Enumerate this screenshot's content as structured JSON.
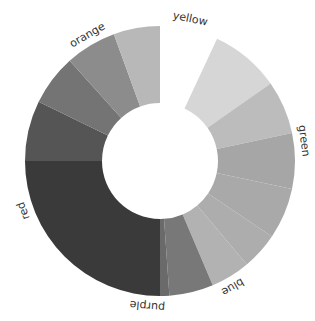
{
  "chart_data": {
    "type": "pie",
    "variant": "donut",
    "title": "",
    "color_scheme": "grayscale",
    "start_gap_degrees": [
      0,
      25
    ],
    "groups": [
      {
        "name": "yellow",
        "label_angle": 12
      },
      {
        "name": "green",
        "label_angle": 82
      },
      {
        "name": "blue",
        "label_angle": 150
      },
      {
        "name": "purple",
        "label_angle": 185
      },
      {
        "name": "red",
        "label_angle": 250
      },
      {
        "name": "orange",
        "label_angle": 330
      }
    ],
    "segments": [
      {
        "group": "yellow",
        "start": 25,
        "end": 55,
        "color": "#d6d6d6"
      },
      {
        "group": "yellow",
        "start": 55,
        "end": 78,
        "color": "#bcbcbc"
      },
      {
        "group": "green",
        "start": 78,
        "end": 102,
        "color": "#a6a6a6"
      },
      {
        "group": "green",
        "start": 102,
        "end": 124,
        "color": "#a9a9a9"
      },
      {
        "group": "green",
        "start": 124,
        "end": 140,
        "color": "#adadad"
      },
      {
        "group": "blue",
        "start": 140,
        "end": 157,
        "color": "#b2b2b2"
      },
      {
        "group": "purple",
        "start": 157,
        "end": 176,
        "color": "#787878"
      },
      {
        "group": "purple",
        "start": 176,
        "end": 180,
        "color": "#6a6a6a"
      },
      {
        "group": "red",
        "start": 180,
        "end": 270,
        "color": "#3a3a3a"
      },
      {
        "group": "orange",
        "start": 270,
        "end": 296,
        "color": "#555555"
      },
      {
        "group": "orange",
        "start": 296,
        "end": 318,
        "color": "#747474"
      },
      {
        "group": "orange",
        "start": 318,
        "end": 340,
        "color": "#8c8c8c"
      },
      {
        "group": "orange",
        "start": 340,
        "end": 360,
        "color": "#b8b8b8"
      }
    ],
    "center": [
      160,
      161
    ],
    "outer_radius": 135,
    "inner_radius": 58,
    "legend": "none",
    "labels": [
      "yellow",
      "green",
      "blue",
      "purple",
      "red",
      "orange"
    ]
  }
}
